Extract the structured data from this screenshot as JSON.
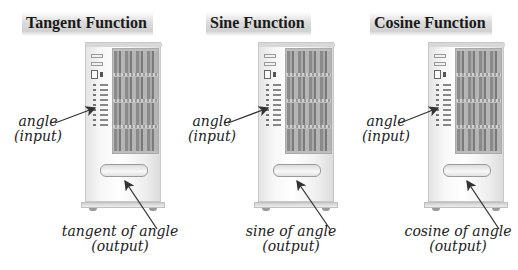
{
  "panels": [
    {
      "title": "Tangent Function",
      "input_label": {
        "line1": "angle",
        "line2": "(input)"
      },
      "output_label": {
        "line1": "tangent of angle",
        "line2": "(output)"
      }
    },
    {
      "title": "Sine Function",
      "input_label": {
        "line1": "angle",
        "line2": "(input)"
      },
      "output_label": {
        "line1": "sine of angle",
        "line2": "(output)"
      }
    },
    {
      "title": "Cosine Function",
      "input_label": {
        "line1": "angle",
        "line2": "(input)"
      },
      "output_label": {
        "line1": "cosine of angle",
        "line2": "(output)"
      }
    }
  ],
  "colors": {
    "text": "#222222",
    "title_highlight": "#d0d0d0",
    "arrow": "#333333"
  }
}
